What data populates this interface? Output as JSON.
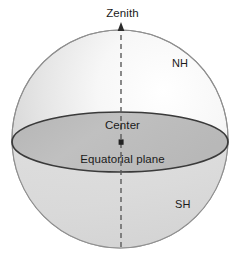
{
  "diagram": {
    "type": "geometric-diagram",
    "background_color": "#ffffff",
    "canvas": {
      "width": 245,
      "height": 264
    },
    "labels": {
      "zenith": "Zenith",
      "northern_hemisphere": "NH",
      "center": "Center",
      "equatorial_plane": "Equatorial plane",
      "southern_hemisphere": "SH"
    },
    "sphere": {
      "center_x": 120,
      "center_y": 139,
      "radius_x": 108,
      "radius_y": 109,
      "outline_color": "#8a8a8a",
      "fill_light": "#fcfcfc",
      "fill_mid": "#e3e3e3",
      "fill_dark": "#cfcfcf"
    },
    "equatorial_ellipse": {
      "center_x": 120,
      "center_y": 142,
      "radius_x": 108,
      "radius_y": 30,
      "fill_color": "#bdbdbd",
      "stroke_color": "#333333",
      "stroke_width": 1.6
    },
    "axis": {
      "x": 121,
      "top_y": 23,
      "bottom_y": 250,
      "color": "#555555",
      "dash_pattern": "5 4",
      "stroke_width": 1.3,
      "arrow_direction": "up",
      "center_marker_y": 142,
      "center_marker_color": "#222222"
    },
    "text_color": "#1a1a1a"
  }
}
